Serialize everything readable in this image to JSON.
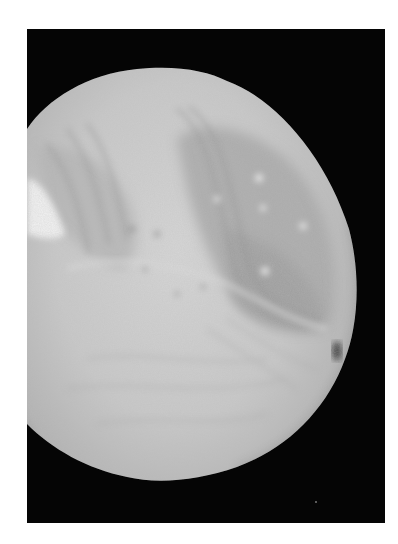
{
  "image": {
    "subject": "Grayscale photograph of a cratered, grooved moon against black space",
    "alt": "Moon surface photograph",
    "colors": {
      "page_background": "#ffffff",
      "space": "#050505",
      "surface_light": "#d8d8d8",
      "surface_mid": "#b4b4b4",
      "surface_dark": "#8c8c8c"
    }
  }
}
